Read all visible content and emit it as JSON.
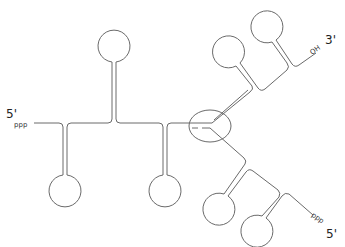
{
  "diagram": {
    "type": "RNA secondary structure (multi-branch stem-loop diagram)",
    "labels": {
      "left_end_prime": "5'",
      "left_end_group": "ppp",
      "top_right_prime": "3'",
      "top_right_group": "OH",
      "bottom_right_prime": "5'",
      "bottom_right_group": "ppp"
    },
    "line_color": "#6a6a6a",
    "features": [
      "hairpin loop 1 (bottom left)",
      "hairpin loop 2 (top center)",
      "hairpin loop 3 (bottom center)",
      "hairpin loop 4 (top right, upper)",
      "hairpin loop 5 (top right, lower)",
      "hairpin loop 6 (bottom right, upper)",
      "hairpin loop 7 (bottom right, lower)",
      "junction circled (ellipse)"
    ]
  }
}
